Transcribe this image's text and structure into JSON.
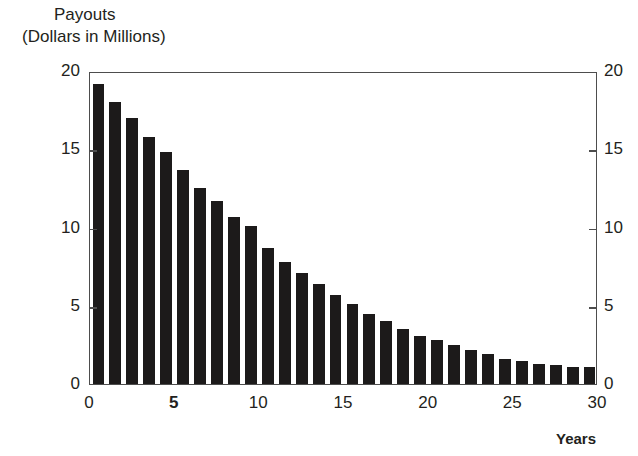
{
  "chart_data": {
    "type": "bar",
    "title": "Payouts",
    "subtitle": "(Dollars in Millions)",
    "xlabel": "Years",
    "ylabel": "",
    "xlim": [
      0,
      30
    ],
    "ylim": [
      0,
      20
    ],
    "grid": false,
    "legend": null,
    "bar_color": "#1c1a1a",
    "frame_color": "#4d4d4d",
    "x_tick_labels": [
      "0",
      "5",
      "10",
      "15",
      "20",
      "25",
      "30"
    ],
    "x_tick_values": [
      0,
      5,
      10,
      15,
      20,
      25,
      30
    ],
    "x_tick_bold": [
      false,
      true,
      false,
      false,
      false,
      false,
      false
    ],
    "y_tick_labels_left": [
      "20",
      "15",
      "10",
      "5",
      "0"
    ],
    "y_tick_labels_right": [
      "20",
      "15",
      "10",
      "5",
      "0"
    ],
    "y_tick_values": [
      20,
      15,
      10,
      5,
      0
    ],
    "categories": [
      1,
      2,
      3,
      4,
      5,
      6,
      7,
      8,
      9,
      10,
      11,
      12,
      13,
      14,
      15,
      16,
      17,
      18,
      19,
      20,
      21,
      22,
      23,
      24,
      25,
      26,
      27,
      28,
      29,
      30
    ],
    "values": [
      19.2,
      18.0,
      17.0,
      15.8,
      14.8,
      13.7,
      12.5,
      11.7,
      10.7,
      10.1,
      8.7,
      7.8,
      7.1,
      6.4,
      5.7,
      5.1,
      4.5,
      4.0,
      3.5,
      3.1,
      2.8,
      2.5,
      2.2,
      1.9,
      1.6,
      1.5,
      1.3,
      1.2,
      1.1,
      1.1
    ]
  }
}
